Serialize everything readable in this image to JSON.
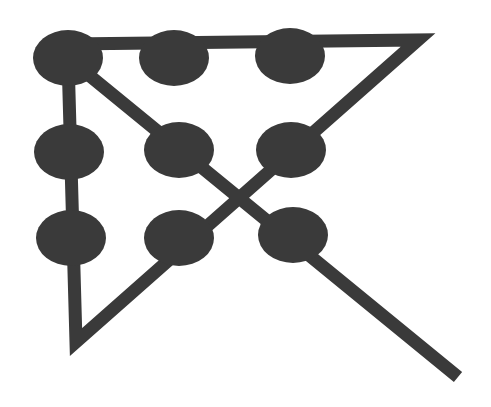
{
  "diagram": {
    "type": "nine-dot-puzzle-solution",
    "colors": {
      "background": "#ffffff",
      "ink": "#3a3a3a"
    },
    "stroke_width": 13,
    "dot_radius_x": 35,
    "dot_radius_y": 28,
    "dots": [
      {
        "row": 1,
        "col": 1,
        "cx": 68,
        "cy": 58
      },
      {
        "row": 1,
        "col": 2,
        "cx": 174,
        "cy": 58
      },
      {
        "row": 1,
        "col": 3,
        "cx": 290,
        "cy": 56
      },
      {
        "row": 2,
        "col": 1,
        "cx": 69,
        "cy": 152
      },
      {
        "row": 2,
        "col": 2,
        "cx": 179,
        "cy": 150
      },
      {
        "row": 2,
        "col": 3,
        "cx": 291,
        "cy": 150
      },
      {
        "row": 3,
        "col": 1,
        "cx": 71,
        "cy": 238
      },
      {
        "row": 3,
        "col": 2,
        "cx": 179,
        "cy": 238
      },
      {
        "row": 3,
        "col": 3,
        "cx": 293,
        "cy": 235
      }
    ],
    "path_points": [
      {
        "x": 68,
        "y": 44
      },
      {
        "x": 418,
        "y": 40
      },
      {
        "x": 76,
        "y": 342
      },
      {
        "x": 68,
        "y": 58
      },
      {
        "x": 458,
        "y": 377
      }
    ],
    "line_segments": 4
  }
}
